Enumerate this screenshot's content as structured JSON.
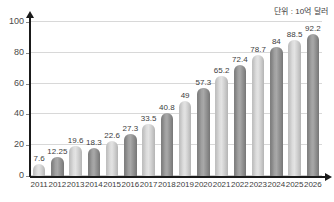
{
  "chart_data": {
    "type": "bar",
    "title": "",
    "subtitle": "",
    "unit_note": "단위 : 10억 달러",
    "xlabel": "",
    "ylabel": "",
    "ylim": [
      0,
      100
    ],
    "yticks": [
      0,
      20,
      40,
      60,
      80,
      100
    ],
    "grid": true,
    "legend": "none",
    "categories": [
      "2011",
      "2012",
      "2013",
      "2014",
      "2015",
      "2016",
      "2017",
      "2018",
      "2019",
      "2020",
      "2021",
      "2022",
      "2023",
      "2024",
      "2025",
      "2026"
    ],
    "values": [
      7.6,
      12.25,
      19.6,
      18.3,
      22.6,
      27.3,
      33.5,
      40.8,
      49,
      57.3,
      65.2,
      72.4,
      78.7,
      84,
      88.5,
      92.2
    ],
    "value_labels": [
      "7.6",
      "12.25",
      "19.6",
      "18.3",
      "22.6",
      "27.3",
      "33.5",
      "40.8",
      "49",
      "57.3",
      "65.2",
      "72.4",
      "78.7",
      "84",
      "88.5",
      "92.2"
    ],
    "bar_shades": [
      "light",
      "dark",
      "light",
      "dark",
      "light",
      "dark",
      "light",
      "dark",
      "light",
      "dark",
      "light",
      "dark",
      "light",
      "dark",
      "light",
      "dark"
    ],
    "colors": {
      "bar_light": "#dcdcdc",
      "bar_dark": "#969696",
      "axis": "#1a1a1a",
      "gridline": "#d8d8d8",
      "text": "#3d3d3d",
      "background": "#ffffff"
    }
  }
}
